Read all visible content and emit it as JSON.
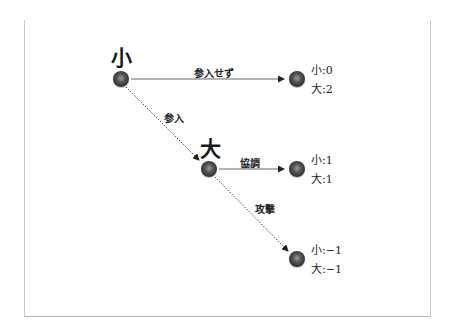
{
  "diagram": {
    "type": "game-tree",
    "players": {
      "root": "小",
      "second": "大"
    },
    "actions": {
      "stay_out": "参入せず",
      "enter": "参入",
      "cooperate": "協調",
      "attack": "攻撃"
    },
    "payoffs": {
      "stay_out": {
        "small": "小:0",
        "large": "大:2"
      },
      "cooperate": {
        "small": "小:1",
        "large": "大:1"
      },
      "attack": {
        "small": "小:−1",
        "large": "大:−1"
      }
    },
    "colors": {
      "node": "#3a3a3a",
      "edge": "#555555",
      "frame": "#c8c8c8"
    }
  }
}
